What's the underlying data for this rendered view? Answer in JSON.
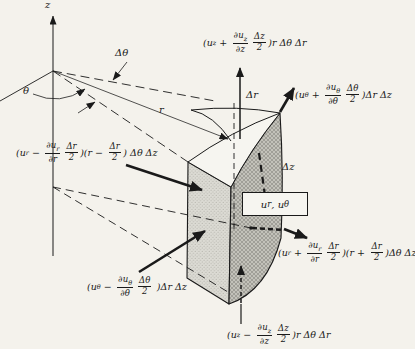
{
  "figure": {
    "colors": {
      "ink": "#1a1a1a",
      "paper": "#f4f2ec",
      "face_light": "#dcdbd4",
      "face_dark": "#c3c2ba"
    },
    "axis_labels": {
      "z": "z",
      "theta": "θ",
      "r": "r",
      "delta_theta": "Δθ",
      "delta_r": "Δr",
      "delta_z": "Δz"
    },
    "center_label": [
      [
        "t",
        "u"
      ],
      [
        "s",
        "r"
      ],
      [
        "t",
        ",  u"
      ],
      [
        "s",
        "θ"
      ]
    ],
    "flux_labels": {
      "flux_z_plus": [
        [
          "t",
          "(u"
        ],
        [
          "s",
          "z"
        ],
        [
          "t",
          " + "
        ],
        [
          "f",
          "∂u",
          "z",
          "∂z"
        ],
        [
          "f",
          "Δz",
          "",
          "2"
        ],
        [
          "t",
          ")r Δθ Δr"
        ]
      ],
      "flux_theta_plus": [
        [
          "t",
          "(u"
        ],
        [
          "s",
          "θ"
        ],
        [
          "t",
          " + "
        ],
        [
          "f",
          "∂u",
          "θ",
          "∂θ"
        ],
        [
          "f",
          "Δθ",
          "",
          "2"
        ],
        [
          "t",
          ")Δr Δz"
        ]
      ],
      "flux_r_minus": [
        [
          "t",
          "(u"
        ],
        [
          "s",
          "r"
        ],
        [
          "t",
          " − "
        ],
        [
          "f",
          "∂u",
          "r",
          "∂r"
        ],
        [
          "f",
          "Δr",
          "",
          "2"
        ],
        [
          "t",
          ")(r − "
        ],
        [
          "f",
          "Δr",
          "",
          "2"
        ],
        [
          "t",
          ") Δθ Δz"
        ]
      ],
      "flux_r_plus": [
        [
          "t",
          "(u"
        ],
        [
          "s",
          "r"
        ],
        [
          "t",
          " + "
        ],
        [
          "f",
          "∂u",
          "r",
          "∂r"
        ],
        [
          "f",
          "Δr",
          "",
          "2"
        ],
        [
          "t",
          ")(r + "
        ],
        [
          "f",
          "Δr",
          "",
          "2"
        ],
        [
          "t",
          ")Δθ Δz"
        ]
      ],
      "flux_theta_minus": [
        [
          "t",
          "(u"
        ],
        [
          "s",
          "θ"
        ],
        [
          "t",
          " − "
        ],
        [
          "f",
          "∂u",
          "θ",
          "∂θ"
        ],
        [
          "f",
          "Δθ",
          "",
          "2"
        ],
        [
          "t",
          " )Δr Δz"
        ]
      ],
      "flux_z_minus": [
        [
          "t",
          "(u"
        ],
        [
          "s",
          "z"
        ],
        [
          "t",
          " − "
        ],
        [
          "f",
          "∂u",
          "z",
          "∂z"
        ],
        [
          "f",
          "Δz",
          "",
          "2"
        ],
        [
          "t",
          ")r Δθ Δr"
        ]
      ]
    }
  }
}
